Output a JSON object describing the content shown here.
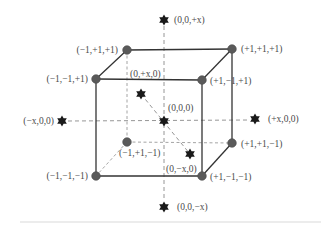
{
  "figure": {
    "colors": {
      "vertex": "#5a5a5a",
      "star": "#1a1a1a",
      "solid_edge": "#333333",
      "dashed_line": "#8a8a8a",
      "text": "#4a4a4a"
    }
  },
  "vertices": [
    {
      "id": "v_m1_p1_p1",
      "label": "(−1,+1,+1)"
    },
    {
      "id": "v_p1_p1_p1",
      "label": "(+1,+1,+1)"
    },
    {
      "id": "v_m1_m1_p1",
      "label": "(−1,−1,+1)"
    },
    {
      "id": "v_p1_m1_p1",
      "label": "(+1,−1,+1)"
    },
    {
      "id": "v_m1_p1_m1",
      "label": "(−1,+1,−1)"
    },
    {
      "id": "v_p1_p1_m1",
      "label": "(+1,+1,−1)"
    },
    {
      "id": "v_m1_m1_m1",
      "label": "(−1,−1,−1)"
    },
    {
      "id": "v_p1_m1_m1",
      "label": "(+1,−1,−1)"
    }
  ],
  "stars": [
    {
      "id": "s_top",
      "label": "(0,0,+x)"
    },
    {
      "id": "s_bottom",
      "label": "(0,0,−x)"
    },
    {
      "id": "s_left",
      "label": "(−x,0,0)"
    },
    {
      "id": "s_right",
      "label": "(+x,0,0)"
    },
    {
      "id": "s_back",
      "label": "(0,+x,0)"
    },
    {
      "id": "s_front",
      "label": "(0,−x,0)"
    },
    {
      "id": "s_center",
      "label": "(0,0,0)"
    }
  ]
}
